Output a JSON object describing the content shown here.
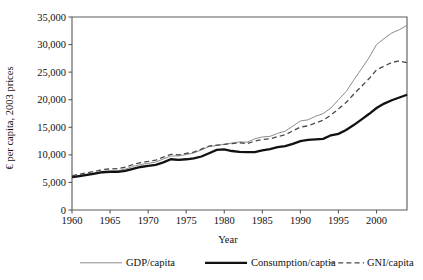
{
  "chart_data": {
    "type": "line",
    "title": "",
    "xlabel": "Year",
    "ylabel": "€ per capita, 2003 prices",
    "xlim": [
      1960,
      2004
    ],
    "ylim": [
      0,
      35000
    ],
    "grid": false,
    "legend_position": "bottom",
    "xticks": [
      "1960",
      "1965",
      "1970",
      "1975",
      "1980",
      "1985",
      "1990",
      "1995",
      "2000"
    ],
    "xtick_values": [
      1960,
      1965,
      1970,
      1975,
      1980,
      1985,
      1990,
      1995,
      2000
    ],
    "yticks": [
      "0",
      "5,000",
      "10,000",
      "15,000",
      "20,000",
      "25,000",
      "30,000",
      "35,000"
    ],
    "ytick_values": [
      0,
      5000,
      10000,
      15000,
      20000,
      25000,
      30000,
      35000
    ],
    "x": [
      1960,
      1961,
      1962,
      1963,
      1964,
      1965,
      1966,
      1967,
      1968,
      1969,
      1970,
      1971,
      1972,
      1973,
      1974,
      1975,
      1976,
      1977,
      1978,
      1979,
      1980,
      1981,
      1982,
      1983,
      1984,
      1985,
      1986,
      1987,
      1988,
      1989,
      1990,
      1991,
      1992,
      1993,
      1994,
      1995,
      1996,
      1997,
      1998,
      1999,
      2000,
      2001,
      2002,
      2003,
      2004
    ],
    "series": [
      {
        "name": "GDP/capita",
        "style": "thin-solid",
        "color": "#8d8d8d",
        "values": [
          6100,
          6300,
          6500,
          6700,
          7000,
          7100,
          7150,
          7400,
          7900,
          8250,
          8450,
          8700,
          9250,
          9800,
          9800,
          10050,
          10350,
          10900,
          11500,
          11700,
          11900,
          12150,
          12350,
          12300,
          12900,
          13250,
          13350,
          13900,
          14300,
          15200,
          16150,
          16350,
          17000,
          17500,
          18500,
          20000,
          21450,
          23550,
          25550,
          27600,
          30000,
          31100,
          32100,
          32700,
          33500
        ]
      },
      {
        "name": "Consumption/captia",
        "style": "thick-solid",
        "color": "#111111",
        "values": [
          5950,
          6150,
          6350,
          6600,
          6850,
          6900,
          6900,
          7100,
          7450,
          7800,
          8000,
          8200,
          8650,
          9200,
          9100,
          9200,
          9350,
          9700,
          10300,
          10900,
          11000,
          10700,
          10550,
          10500,
          10500,
          10800,
          11050,
          11400,
          11600,
          12000,
          12500,
          12700,
          12800,
          12900,
          13550,
          13800,
          14500,
          15400,
          16400,
          17400,
          18500,
          19300,
          19900,
          20400,
          20900
        ]
      },
      {
        "name": "GNI/capita",
        "style": "dashed",
        "color": "#4a4a4a",
        "values": [
          6200,
          6500,
          6750,
          7000,
          7350,
          7450,
          7500,
          7750,
          8250,
          8600,
          8800,
          9050,
          9600,
          10100,
          10000,
          10250,
          10500,
          11050,
          11600,
          11750,
          11900,
          12050,
          12200,
          12050,
          12500,
          12800,
          12900,
          13300,
          13650,
          14350,
          15050,
          15250,
          15800,
          16300,
          17200,
          18350,
          19500,
          21000,
          22400,
          23800,
          25400,
          26100,
          26750,
          27050,
          26700
        ]
      }
    ]
  }
}
